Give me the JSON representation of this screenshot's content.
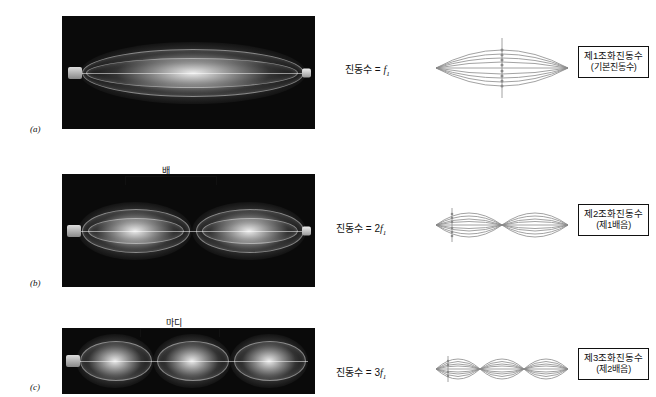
{
  "figure": {
    "rows": [
      {
        "id": "row-a",
        "letter": "(a)",
        "freq_prefix": "진동수 = ",
        "freq_value": "f",
        "freq_sub": "1",
        "photo_bracket_label": "",
        "caption_line1": "제1조화진동수",
        "caption_line2": "(기본진동수)",
        "loops": 1
      },
      {
        "id": "row-b",
        "letter": "(b)",
        "freq_prefix": "진동수 = 2",
        "freq_value": "f",
        "freq_sub": "1",
        "photo_bracket_label": "배",
        "caption_line1": "제2조화진동수",
        "caption_line2": "(제1배음)",
        "loops": 2
      },
      {
        "id": "row-c",
        "letter": "(c)",
        "freq_prefix": "진동수 = 3",
        "freq_value": "f",
        "freq_sub": "1",
        "photo_bracket_label": "마디",
        "caption_line1": "제3조화진동수",
        "caption_line2": "(제2배음)",
        "loops": 3
      }
    ],
    "colors": {
      "ink": "#111111",
      "photo_background": "#0a0a0a",
      "string_light": "#ffffff",
      "diagram_line": "#8a8a8a",
      "page_background": "#ffffff"
    }
  }
}
